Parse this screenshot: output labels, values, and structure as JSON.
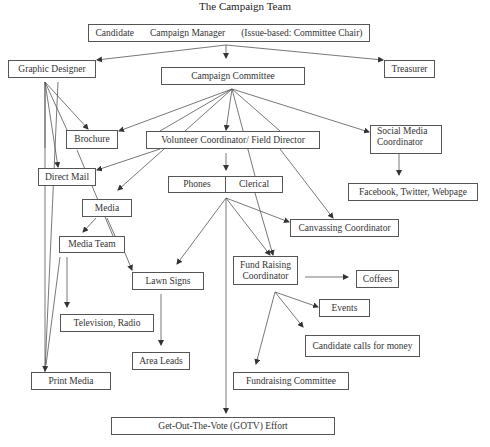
{
  "title": "The Campaign Team",
  "top_box": {
    "candidate": "Candidate",
    "manager": "Campaign Manager",
    "chair": "(Issue-based: Committee Chair)"
  },
  "nodes": {
    "graphic_designer": "Graphic Designer",
    "campaign_committee": "Campaign Committee",
    "treasurer": "Treasurer",
    "brochure": "Brochure",
    "volunteer_coordinator": "Volunteer Coordinator/ Field Director",
    "social_media_line1": "Social Media",
    "social_media_line2": "Coordinator",
    "direct_mail": "Direct Mail",
    "phones": "Phones",
    "clerical": "Clerical",
    "facebook": "Facebook, Twitter, Webpage",
    "media": "Media",
    "canvassing": "Canvassing Coordinator",
    "media_team": "Media Team",
    "lawn_signs": "Lawn Signs",
    "fund_raising_line1": "Fund Raising",
    "fund_raising_line2": "Coordinator",
    "coffees": "Coffees",
    "events": "Events",
    "tv_radio": "Television, Radio",
    "candidate_calls": "Candidate calls for money",
    "area_leads": "Area Leads",
    "print_media": "Print Media",
    "fundraising_committee": "Fundraising Committee",
    "gotv": "Get-Out-The-Vote (GOTV) Effort"
  },
  "edges": [
    [
      "Campaign Manager",
      "Graphic Designer"
    ],
    [
      "Campaign Manager",
      "Campaign Committee"
    ],
    [
      "Campaign Manager",
      "Treasurer"
    ],
    [
      "Graphic Designer",
      "Brochure"
    ],
    [
      "Graphic Designer",
      "Direct Mail"
    ],
    [
      "Graphic Designer",
      "Print Media"
    ],
    [
      "Campaign Committee",
      "Brochure"
    ],
    [
      "Campaign Committee",
      "Volunteer Coordinator/ Field Director"
    ],
    [
      "Campaign Committee",
      "Social Media Coordinator"
    ],
    [
      "Campaign Committee",
      "Direct Mail"
    ],
    [
      "Campaign Committee",
      "Media"
    ],
    [
      "Campaign Committee",
      "Fund Raising Coordinator"
    ],
    [
      "Campaign Committee",
      "Canvassing Coordinator"
    ],
    [
      "Volunteer Coordinator/ Field Director",
      "Phones | Clerical"
    ],
    [
      "Social Media Coordinator",
      "Facebook, Twitter, Webpage"
    ],
    [
      "Brochure",
      "Media Team"
    ],
    [
      "Media",
      "Media Team"
    ],
    [
      "Media",
      "Lawn Signs"
    ],
    [
      "Phones | Clerical",
      "Lawn Signs"
    ],
    [
      "Phones | Clerical",
      "Canvassing Coordinator"
    ],
    [
      "Phones | Clerical",
      "Fund Raising Coordinator"
    ],
    [
      "Phones | Clerical",
      "Get-Out-The-Vote (GOTV) Effort"
    ],
    [
      "Media Team",
      "Television, Radio"
    ],
    [
      "Media Team",
      "Print Media"
    ],
    [
      "Lawn Signs",
      "Area Leads"
    ],
    [
      "Fund Raising Coordinator",
      "Coffees"
    ],
    [
      "Fund Raising Coordinator",
      "Events"
    ],
    [
      "Fund Raising Coordinator",
      "Candidate calls for money"
    ],
    [
      "Fund Raising Coordinator",
      "Fundraising Committee"
    ]
  ]
}
